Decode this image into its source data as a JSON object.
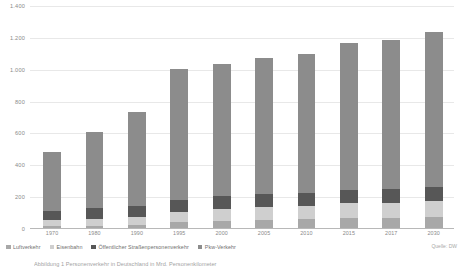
{
  "chart_data": {
    "type": "bar",
    "subtype": "stacked-bar",
    "title": "",
    "xlabel": "",
    "ylabel": "",
    "ylim": [
      0,
      1400
    ],
    "ytick_step": 200,
    "grid": true,
    "legend_position": "bottom-left",
    "categories": [
      "1970",
      "1980",
      "1990",
      "1995",
      "2000",
      "2005",
      "2010",
      "2015",
      "2017",
      "2030"
    ],
    "ytick_labels": [
      "0",
      "200",
      "400",
      "600",
      "800",
      "1.000",
      "1.200",
      "1.400"
    ],
    "ytick_values": [
      0,
      200,
      400,
      600,
      800,
      1000,
      1200,
      1400
    ],
    "series": [
      {
        "name": "Luftverkehr",
        "color": "#a8a8a8",
        "values": [
          10,
          14,
          22,
          38,
          44,
          52,
          56,
          62,
          64,
          70
        ]
      },
      {
        "name": "Eisenbahn",
        "color": "#cfcfcf",
        "values": [
          38,
          42,
          46,
          62,
          74,
          78,
          84,
          92,
          94,
          100
        ]
      },
      {
        "name": "Öffentlicher Straßenpersonenverkehr",
        "color": "#575757",
        "values": [
          62,
          68,
          70,
          78,
          80,
          84,
          82,
          86,
          86,
          90
        ]
      },
      {
        "name": "Pkw-Verkehr",
        "color": "#8c8c8c",
        "values": [
          370,
          476,
          592,
          822,
          832,
          856,
          868,
          920,
          936,
          970
        ]
      }
    ],
    "totals": [
      480,
      600,
      730,
      1000,
      1030,
      1070,
      1090,
      1160,
      1180,
      1230
    ]
  },
  "legend": {
    "items": [
      {
        "label": "Luftverkehr"
      },
      {
        "label": "Eisenbahn"
      },
      {
        "label": "Öffentlicher Straßenpersonenverkehr"
      },
      {
        "label": "Pkw-Verkehr"
      }
    ]
  },
  "source": {
    "text": "Quelle: DW"
  },
  "caption": {
    "text": "Abbildung 1 Personenverkehr in Deutschland in Mrd. Personenkilometer"
  }
}
